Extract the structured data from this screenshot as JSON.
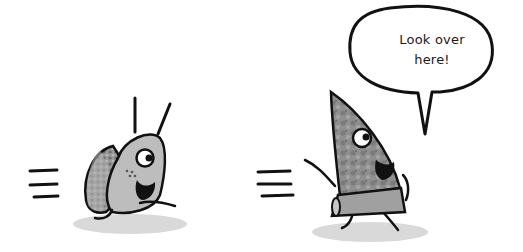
{
  "speech_bubble": {
    "line1": "Look over",
    "line2": "here!"
  },
  "characters": [
    {
      "name": "snail-character",
      "description": "cartoon snail running, grey body with textured shell"
    },
    {
      "name": "rock-character",
      "description": "cartoon triangular rock shard running, textured grey"
    }
  ],
  "colors": {
    "outline": "#111111",
    "snail_body": "#bdbdbd",
    "shell": "#a8a8a8",
    "rock": "#8e8e8e",
    "shadow": "#dcdcdc",
    "background": "#ffffff"
  }
}
